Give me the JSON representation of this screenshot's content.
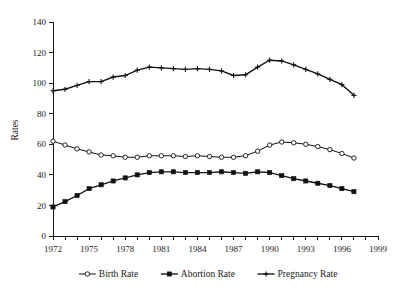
{
  "chart_data": {
    "type": "line",
    "title": "",
    "subtitle": "",
    "xlabel": "",
    "ylabel": "Rates",
    "xlim": [
      1972,
      1999
    ],
    "ylim": [
      0,
      140
    ],
    "grid": false,
    "legend_position": "bottom",
    "y_ticks": [
      0,
      20,
      40,
      60,
      80,
      100,
      120,
      140
    ],
    "y_tick_labels": [
      "0",
      "20",
      "40",
      "60",
      "80",
      "100",
      "120",
      "140"
    ],
    "x_ticks": [
      1972,
      1973,
      1974,
      1975,
      1976,
      1977,
      1978,
      1979,
      1980,
      1981,
      1982,
      1983,
      1984,
      1985,
      1986,
      1987,
      1988,
      1989,
      1990,
      1991,
      1992,
      1993,
      1994,
      1995,
      1996,
      1997,
      1998,
      1999
    ],
    "x_tick_labels": [
      "1972",
      "1975",
      "1978",
      "1981",
      "1984",
      "1987",
      "1990",
      "1993",
      "1996",
      "1999"
    ],
    "x_labeled_ticks": [
      1972,
      1975,
      1978,
      1981,
      1984,
      1987,
      1990,
      1993,
      1996,
      1999
    ],
    "x": [
      1972,
      1973,
      1974,
      1975,
      1976,
      1977,
      1978,
      1979,
      1980,
      1981,
      1982,
      1983,
      1984,
      1985,
      1986,
      1987,
      1988,
      1989,
      1990,
      1991,
      1992,
      1993,
      1994,
      1995,
      1996,
      1997
    ],
    "series": [
      {
        "name": "Birth Rate",
        "marker": "open-circle",
        "values": [
          62.0,
          59.5,
          57.0,
          55.0,
          53.0,
          52.5,
          51.5,
          51.5,
          52.5,
          52.5,
          52.5,
          52.0,
          52.5,
          52.0,
          51.5,
          51.5,
          52.5,
          55.5,
          59.5,
          61.5,
          61.0,
          60.0,
          58.5,
          56.5,
          54.0,
          51.0
        ]
      },
      {
        "name": "Abortion Rate",
        "marker": "filled-square",
        "values": [
          19.0,
          22.5,
          26.5,
          31.0,
          33.5,
          36.0,
          38.0,
          40.0,
          41.5,
          42.0,
          42.0,
          41.5,
          41.5,
          41.5,
          42.0,
          41.5,
          41.0,
          42.0,
          41.5,
          39.5,
          37.5,
          36.0,
          34.5,
          33.0,
          31.0,
          29.0
        ]
      },
      {
        "name": "Pregnancy Rate",
        "marker": "plus",
        "values": [
          95.0,
          96.0,
          98.5,
          101.0,
          101.0,
          104.0,
          105.0,
          108.5,
          110.5,
          110.0,
          109.5,
          109.0,
          109.5,
          109.0,
          108.0,
          105.0,
          105.5,
          110.5,
          115.0,
          114.5,
          112.0,
          109.0,
          106.0,
          102.5,
          99.0,
          92.0
        ]
      }
    ],
    "annotations": []
  },
  "legend": {
    "items": [
      {
        "label": "Birth Rate",
        "marker": "open-circle"
      },
      {
        "label": "Abortion Rate",
        "marker": "filled-square"
      },
      {
        "label": "Pregnancy Rate",
        "marker": "plus"
      }
    ]
  },
  "colors": {
    "line": "#111111",
    "axis": "#1a1a1a",
    "background": "#ffffff",
    "marker_fill_open": "#ffffff"
  }
}
